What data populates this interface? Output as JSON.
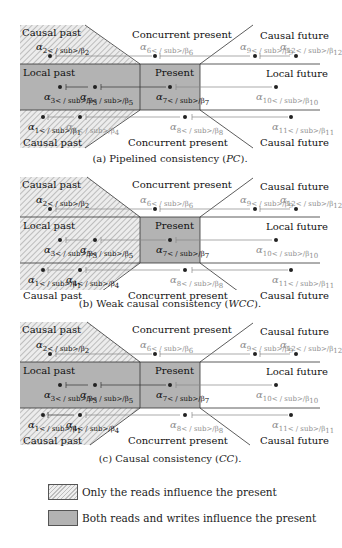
{
  "diagrams": [
    {
      "id": "a",
      "caption_prefix": "(a) Pipelined consistency (",
      "caption_abbr": "PC",
      "caption_suffix": ").",
      "regions": {
        "causal_past_top": "Causal past",
        "concurrent_present_top": "Concurrent present",
        "causal_future_top": "Causal future",
        "local_past": "Local past",
        "present": "Present",
        "local_future": "Local future",
        "causal_past_bottom": "Causal past",
        "concurrent_present_bottom": "Concurrent present",
        "causal_future_bottom": "Causal future"
      },
      "labels": {
        "a1": "α1/β1",
        "a2": "α2/β2",
        "a3": "α3/β3",
        "a4": "α4/β4",
        "a5": "α5/β5",
        "a6": "α6/β6",
        "a7": "α7/β7",
        "a8": "α8/β8",
        "a9": "α9/β9",
        "a10": "α10/β10",
        "a11": "α11/β11",
        "a12": "α12/β12"
      },
      "shading": "local_past_solid_causal_past_hatched_partial"
    },
    {
      "id": "b",
      "caption_prefix": "(b) Weak causal consistency (",
      "caption_abbr": "WCC",
      "caption_suffix": ").",
      "regions": {
        "causal_past_top": "Causal past",
        "concurrent_present_top": "Concurrent present",
        "causal_future_top": "Causal future",
        "local_past": "Local past",
        "present": "Present",
        "local_future": "Local future",
        "causal_past_bottom": "Causal past",
        "concurrent_present_bottom": "Concurrent present",
        "causal_future_bottom": "Causal future"
      },
      "labels": {
        "a1": "α1/β1",
        "a2": "α2/β2",
        "a3": "α3/β3",
        "a4": "α4/β4",
        "a5": "α5/β5",
        "a6": "α6/β6",
        "a7": "α7/β7",
        "a8": "α8/β8",
        "a9": "α9/β9",
        "a10": "α10/β10",
        "a11": "α11/β11",
        "a12": "α12/β12"
      },
      "shading": "whole_past_hatched_present_solid"
    },
    {
      "id": "c",
      "caption_prefix": "(c) Causal consistency (",
      "caption_abbr": "CC",
      "caption_suffix": ").",
      "regions": {
        "causal_past_top": "Causal past",
        "concurrent_present_top": "Concurrent present",
        "causal_future_top": "Causal future",
        "local_past": "Local past",
        "present": "Present",
        "local_future": "Local future",
        "causal_past_bottom": "Causal past",
        "concurrent_present_bottom": "Concurrent present",
        "causal_future_bottom": "Causal future"
      },
      "labels": {
        "a1": "α1/β1",
        "a2": "α2/β2",
        "a3": "α3/β3",
        "a4": "α4/β4",
        "a5": "α5/β5",
        "a6": "α6/β6",
        "a7": "α7/β7",
        "a8": "α8/β8",
        "a9": "α9/β9",
        "a10": "α10/β10",
        "a11": "α11/β11",
        "a12": "α12/β12"
      },
      "shading": "local_past_solid_causal_past_hatched"
    }
  ],
  "legend": {
    "hatched_label": "Only the reads influence the present",
    "solid_label": "Both reads and writes influence the present"
  },
  "colors": {
    "solid_fill": "#b3b3b3",
    "hatch_stroke": "#a8a8a8",
    "hatch_bg": "#ececec",
    "line": "#333333",
    "faint_text": "#8e8e8e"
  }
}
